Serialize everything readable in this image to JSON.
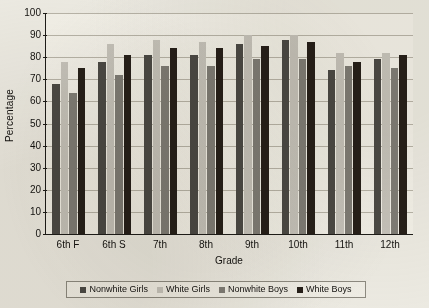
{
  "chart_data": {
    "type": "bar",
    "title": "",
    "xlabel": "Grade",
    "ylabel": "Percentage",
    "ylim": [
      0,
      100
    ],
    "ytick_step": 10,
    "yticks": [
      0,
      10,
      20,
      30,
      40,
      50,
      60,
      70,
      80,
      90,
      100
    ],
    "grid": true,
    "legend_position": "bottom",
    "categories": [
      "6th F",
      "6th S",
      "7th",
      "8th",
      "9th",
      "10th",
      "11th",
      "12th"
    ],
    "series": [
      {
        "name": "Nonwhite Girls",
        "color": "#4c4a45",
        "values": [
          68,
          78,
          81,
          81,
          86,
          88,
          74,
          79
        ]
      },
      {
        "name": "White Girls",
        "color": "#c6c3bb",
        "values": [
          78,
          86,
          88,
          87,
          90,
          90,
          82,
          82
        ]
      },
      {
        "name": "Nonwhite Boys",
        "color": "#807d76",
        "values": [
          64,
          72,
          76,
          76,
          79,
          79,
          76,
          75
        ]
      },
      {
        "name": "White Boys",
        "color": "#272019",
        "values": [
          75,
          81,
          84,
          84,
          85,
          87,
          78,
          81
        ]
      }
    ]
  }
}
